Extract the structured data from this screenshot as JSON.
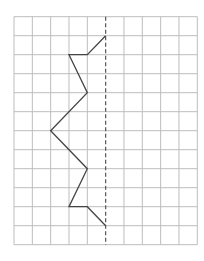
{
  "diagram": {
    "type": "grid-symmetry-figure",
    "grid": {
      "columns": 10,
      "rows": 12,
      "origin_px": [
        14,
        16.7
      ],
      "cell_w_px": 18.33,
      "cell_h_px": 19.0,
      "line_color": "#bdbdbd",
      "line_width": 1
    },
    "axis_of_symmetry": {
      "orientation": "vertical",
      "column_index": 5,
      "style": "dashed",
      "color": "#555555",
      "dash": "4,2.5"
    },
    "polyline": {
      "color": "#444444",
      "width": 1.3,
      "points_grid": [
        [
          5,
          1
        ],
        [
          4,
          2
        ],
        [
          3,
          2
        ],
        [
          4,
          4
        ],
        [
          2,
          6
        ],
        [
          4,
          8
        ],
        [
          3,
          10
        ],
        [
          4,
          10
        ],
        [
          5,
          11
        ]
      ]
    }
  }
}
